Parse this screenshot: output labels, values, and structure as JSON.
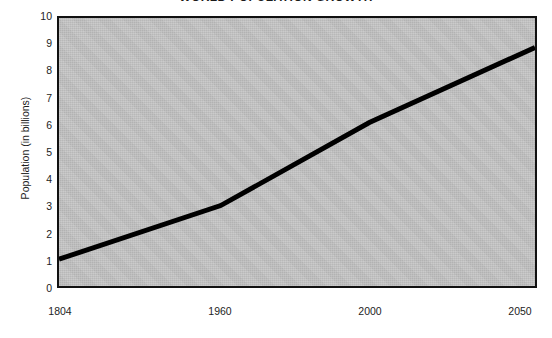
{
  "chart_data": {
    "type": "line",
    "title": "WORLD POPULATION GROWTH",
    "subtitle": "",
    "xlabel": "",
    "ylabel": "Population (in billions)",
    "x": [
      1804,
      1960,
      2000,
      2050
    ],
    "values": [
      1.0,
      3.0,
      6.1,
      8.9
    ],
    "categories": [
      "1804",
      "1960",
      "2000",
      "2050"
    ],
    "series": [
      {
        "name": "World population",
        "values": [
          1.0,
          3.0,
          6.1,
          8.9
        ]
      }
    ],
    "xtick_labels": [
      "1804",
      "1960",
      "2000",
      "2050"
    ],
    "xtick_positions_px": [
      60,
      220,
      370,
      520
    ],
    "ytick_labels": [
      "0",
      "1",
      "2",
      "3",
      "4",
      "5",
      "6",
      "7",
      "8",
      "9",
      "10"
    ],
    "ylim": [
      0,
      10
    ],
    "ytick_step": 1,
    "grid": false,
    "legend": false,
    "legend_position": "none",
    "annotations": [],
    "note": "x-axis spacing is non-linear; year ticks are evenly-ish placed by label"
  },
  "style": {
    "plot_background": "#c4c4c4",
    "plot_border": "#111111",
    "line_color": "#000000",
    "text_color": "#1d1d1d",
    "page_background": "#ffffff"
  }
}
